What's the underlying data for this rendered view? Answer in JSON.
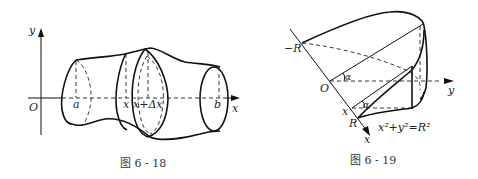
{
  "figure_left": {
    "caption": "图 6 - 18",
    "labels": {
      "y_axis": "y",
      "x_axis": "x",
      "origin": "O",
      "a": "a",
      "x": "x",
      "x_plus_dx": "x+Δx",
      "b": "b"
    }
  },
  "figure_right": {
    "caption": "图 6 - 19",
    "labels": {
      "neg_R": "−R",
      "origin": "O",
      "y_axis": "y",
      "alpha_top": "α",
      "alpha_bottom": "α",
      "x_point": "x",
      "R": "R",
      "x_axis": "x",
      "equation": "x²+y²=R²"
    }
  }
}
